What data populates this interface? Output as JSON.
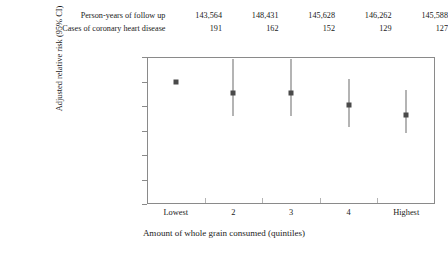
{
  "table": {
    "rows": [
      {
        "label": "Person-years of follow up",
        "values": [
          "143,564",
          "148,431",
          "145,628",
          "146,262",
          "145,588"
        ]
      },
      {
        "label": "Cases of coronary heart disease",
        "values": [
          "191",
          "162",
          "152",
          "129",
          "127"
        ]
      }
    ]
  },
  "chart_data": {
    "type": "scatter",
    "title": "",
    "xlabel": "Amount of whole grain consumed (quintiles)",
    "ylabel": "Adjusted relative risk (95% CI)",
    "categories": [
      "Lowest",
      "2",
      "3",
      "4",
      "Highest"
    ],
    "values": [
      1.0,
      0.91,
      0.91,
      0.81,
      0.73
    ],
    "ci_low": [
      1.0,
      0.72,
      0.72,
      0.63,
      0.58
    ],
    "ci_high": [
      1.0,
      1.18,
      1.18,
      1.02,
      0.93
    ],
    "ylim": [
      0,
      1.2
    ],
    "yticks": [
      "0",
      "0.2",
      "0.4",
      "0.6",
      "0.8",
      "1.0",
      "1.2"
    ],
    "ytick_values": [
      0,
      0.2,
      0.4,
      0.6,
      0.8,
      1.0,
      1.2
    ],
    "grid": false,
    "legend": "none",
    "marker_color": "#4a4a4a",
    "errorbar_color": "#6b6b6b",
    "frame_color": "#8a8a8a"
  }
}
